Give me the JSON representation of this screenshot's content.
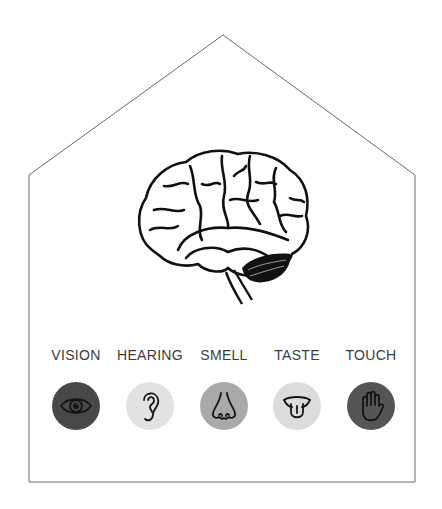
{
  "diagram": {
    "type": "house-outline",
    "center_image": "brain-illustration",
    "outline_color": "#555555"
  },
  "senses": [
    {
      "label": "VISION",
      "icon": "eye-icon",
      "circle_color": "#484848",
      "icon_color": "#1a1a1a",
      "x": 76
    },
    {
      "label": "HEARING",
      "icon": "ear-icon",
      "circle_color": "#e2e2e2",
      "icon_color": "#1a1a1a",
      "x": 150
    },
    {
      "label": "SMELL",
      "icon": "nose-icon",
      "circle_color": "#a9a9a9",
      "icon_color": "#1a1a1a",
      "x": 224
    },
    {
      "label": "TASTE",
      "icon": "tongue-icon",
      "circle_color": "#dcdcdc",
      "icon_color": "#1a1a1a",
      "x": 297
    },
    {
      "label": "TOUCH",
      "icon": "hand-icon",
      "circle_color": "#555555",
      "icon_color": "#1a1a1a",
      "x": 371
    }
  ]
}
